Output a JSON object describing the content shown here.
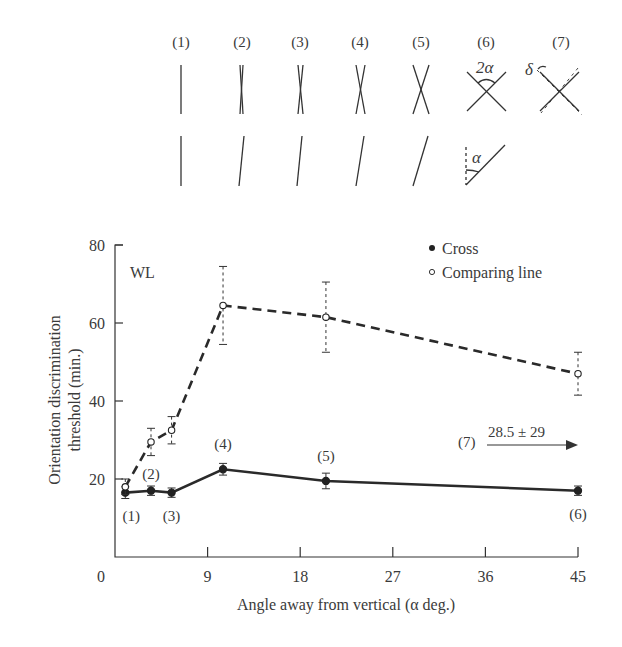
{
  "stimuli": {
    "labels": [
      "(1)",
      "(2)",
      "(3)",
      "(4)",
      "(5)",
      "(6)",
      "(7)"
    ],
    "annotations": {
      "two_alpha": "2α",
      "alpha": "α",
      "delta": "δ"
    }
  },
  "chart_data": {
    "type": "line",
    "title": "",
    "panel_label": "WL",
    "xlabel": "Angle away from vertical (α deg.)",
    "ylabel_line1": "Orientation discrimination",
    "ylabel_line2": "threshold (min.)",
    "xlim": [
      0,
      45
    ],
    "ylim": [
      0,
      80
    ],
    "xticks": [
      0,
      9,
      18,
      27,
      36,
      45
    ],
    "yticks": [
      20,
      40,
      60,
      80
    ],
    "grid": false,
    "legend_position": "top-right",
    "series": [
      {
        "name": "Cross",
        "marker": "filled-circle",
        "line": "solid",
        "x": [
          1,
          3.5,
          5.5,
          10.5,
          20.5,
          45
        ],
        "values": [
          16.5,
          17,
          16.5,
          22.5,
          19.5,
          17
        ],
        "errors": [
          1.5,
          1.2,
          1.2,
          1.5,
          2,
          1.2
        ]
      },
      {
        "name": "Comparing line",
        "marker": "open-circle",
        "line": "dashed",
        "x": [
          1,
          3.5,
          5.5,
          10.5,
          20.5,
          45
        ],
        "values": [
          18,
          29.5,
          32.5,
          64.5,
          61.5,
          47
        ],
        "errors": [
          2,
          3.5,
          3.5,
          10,
          9,
          5.5
        ]
      }
    ],
    "point_labels": [
      {
        "text": "(1)",
        "x": 1,
        "pos": "below"
      },
      {
        "text": "(2)",
        "x": 3.5,
        "pos": "above"
      },
      {
        "text": "(3)",
        "x": 5.5,
        "pos": "below"
      },
      {
        "text": "(4)",
        "x": 10.5,
        "pos": "above"
      },
      {
        "text": "(5)",
        "x": 20.5,
        "pos": "above"
      },
      {
        "text": "(6)",
        "x": 45,
        "pos": "below"
      }
    ],
    "annotation": {
      "label": "(7)",
      "text": "28.5 ± 29",
      "arrow": "right"
    }
  }
}
